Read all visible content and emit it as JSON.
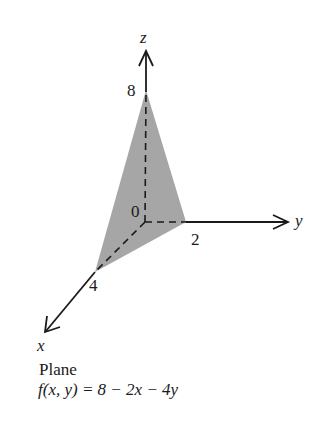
{
  "figure": {
    "type": "3d-plane-intercepts",
    "axes": {
      "z": {
        "label": "z",
        "intercept_label": "8"
      },
      "y": {
        "label": "y",
        "intercept_label": "2"
      },
      "x": {
        "label": "x",
        "intercept_label": "4"
      },
      "origin_label": "0"
    },
    "plane_fill": "#a6a6a6",
    "axis_color": "#1a1a1a"
  },
  "caption": {
    "line1": "Plane",
    "line2": "f(x, y) = 8 − 2x − 4y"
  }
}
